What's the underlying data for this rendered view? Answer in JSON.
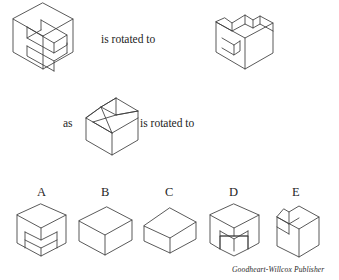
{
  "page": {
    "width": 339,
    "height": 280,
    "background": "#ffffff",
    "line_color": "#3c3c3c",
    "text_color": "#1f1f1f"
  },
  "question": {
    "type": "spatial-visualization-rotation",
    "prompt_row1": "is rotated to",
    "prompt_row2_connector": "as",
    "prompt_row2": "is rotated to"
  },
  "figures": {
    "row1_left": {
      "name": "C-shaped-block-isometric",
      "description": "Isometric C-shaped (channel) block with a deep rectangular slot cut into the front face"
    },
    "row1_right": {
      "name": "L-shaped-block-isometric",
      "description": "Isometric L-shaped block with a small square notch cut in the left side"
    },
    "row2_middle": {
      "name": "wedge-cut-cube-isometric",
      "description": "Isometric cube with an angled wedge cut across the upper-left corner forming a triangular face"
    }
  },
  "answers": {
    "label_row": [
      "A",
      "B",
      "C",
      "D",
      "E"
    ],
    "options": [
      {
        "label": "A",
        "name": "option-a-figure",
        "description": "Cube viewed corner-on with a rectangular notch cut into the bottom front corner"
      },
      {
        "label": "B",
        "name": "option-b-figure",
        "description": "Plain rectangular box in isometric view, no cuts"
      },
      {
        "label": "C",
        "name": "option-c-figure",
        "description": "Plain rectangular box in isometric view, wider and lower than B"
      },
      {
        "label": "D",
        "name": "option-d-figure",
        "description": "Cube viewed corner-on with a rectangular slot cut up from the bottom edge"
      },
      {
        "label": "E",
        "name": "option-e-figure",
        "description": "Box with a small square notch cut in the upper-left side"
      }
    ]
  },
  "credit": {
    "text": "Goodheart-Willcox Publisher"
  }
}
